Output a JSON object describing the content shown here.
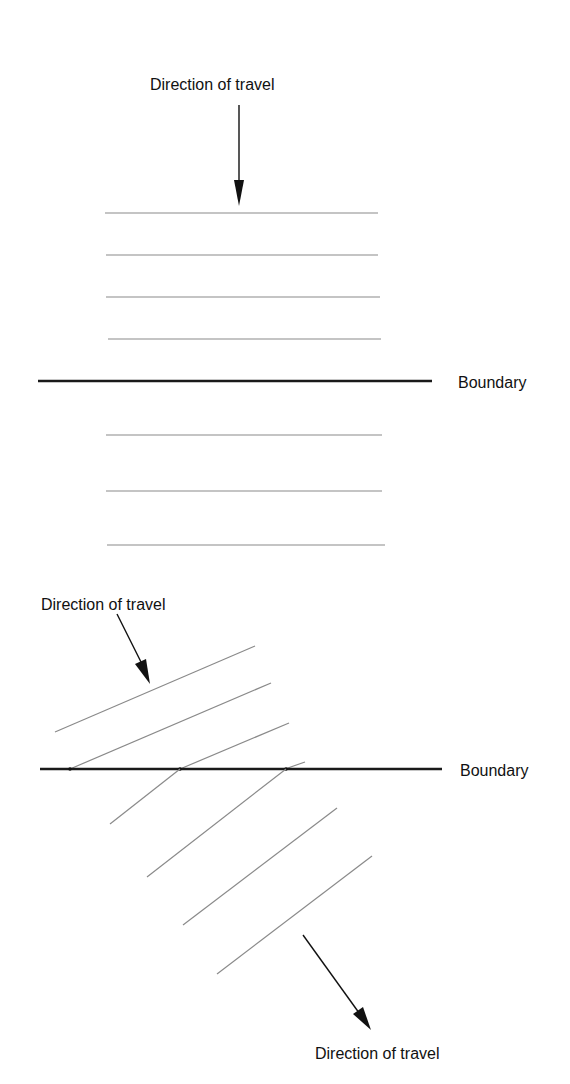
{
  "figure": {
    "top_panel": {
      "direction_label": "Direction of travel",
      "boundary_label": "Boundary",
      "description": "Wavefronts parallel to boundary; normal incidence, no refraction bending"
    },
    "bottom_panel": {
      "incident_direction_label": "Direction of travel",
      "boundary_label": "Boundary",
      "refracted_direction_label": "Direction of travel",
      "description": "Oblique wavefronts crossing boundary change angle (refraction)"
    }
  },
  "colors": {
    "background": "#ffffff",
    "wavefront": "#8a8a8a",
    "boundary": "#1a1a1a",
    "text": "#111111"
  }
}
